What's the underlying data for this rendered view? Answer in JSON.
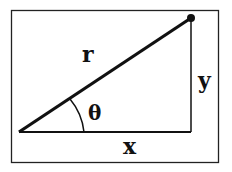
{
  "diagram": {
    "labels": {
      "hypotenuse": "r",
      "opposite": "y",
      "adjacent": "x",
      "angle": "θ"
    },
    "colors": {
      "stroke": "#111111",
      "background": "#ffffff"
    }
  }
}
